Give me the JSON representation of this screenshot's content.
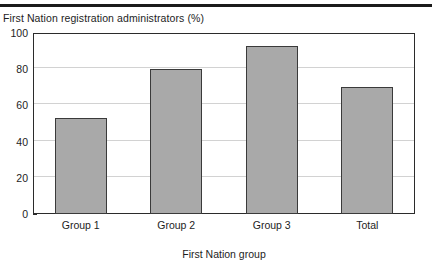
{
  "figure": {
    "title": "First Nation registration administrators (%)",
    "top_rule_color": "#1b1b1b",
    "cut_caption": ""
  },
  "chart_data": {
    "type": "bar",
    "title": "First Nation registration administrators (%)",
    "categories": [
      "Group 1",
      "Group 2",
      "Group 3",
      "Total"
    ],
    "values": [
      53,
      80,
      93,
      70
    ],
    "xlabel": "First Nation group",
    "ylabel": "",
    "ylim": [
      0,
      100
    ],
    "yticks": [
      0,
      20,
      40,
      60,
      80,
      100
    ],
    "ytick_labels": [
      "0",
      "20",
      "40",
      "60",
      "80",
      "100"
    ],
    "grid": true,
    "legend": false,
    "bar_fill_color": "#a9a9a9",
    "bar_edge_color": "#3a3a3a",
    "gridline_color": "#d2d2d2",
    "axis_color": "#2b2b2b"
  }
}
